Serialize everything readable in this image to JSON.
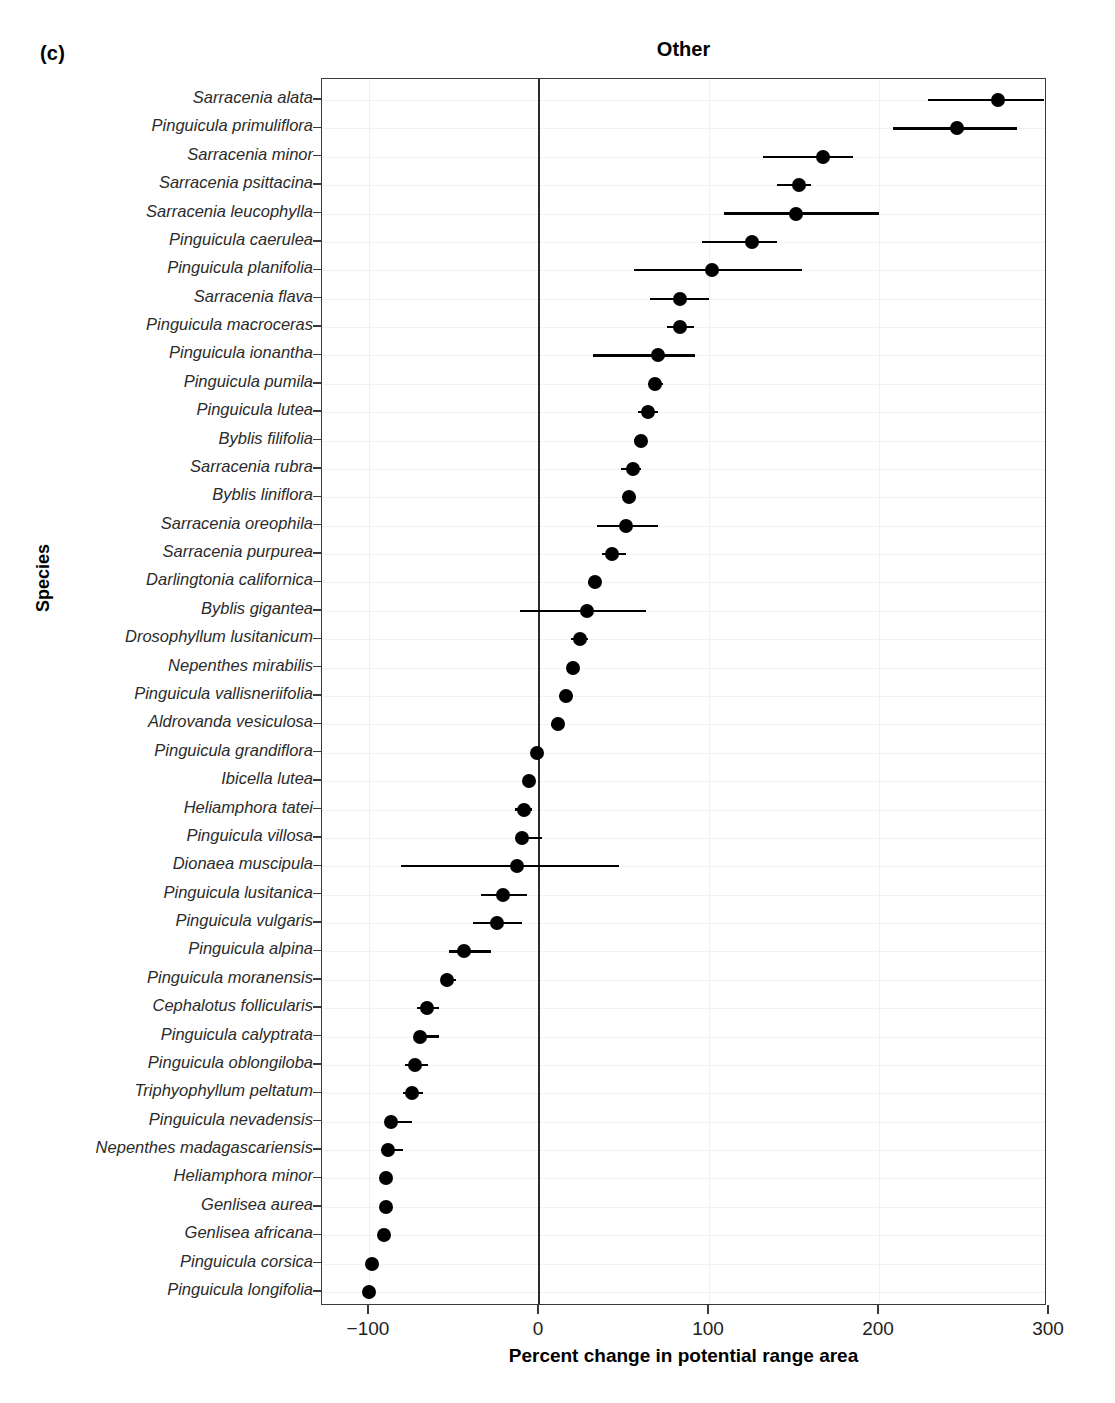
{
  "panel_letter": "(c)",
  "chart_data": {
    "type": "scatter",
    "subtype": "forest-plot",
    "title": "Other",
    "xlabel": "Percent change in potential range area",
    "ylabel": "Species",
    "xlim": [
      -125,
      320
    ],
    "xticks": [
      -100,
      0,
      100,
      200,
      300
    ],
    "xtick_labels": [
      "−100",
      "0",
      "100",
      "200",
      "300"
    ],
    "grid": true,
    "zero_reference_line": 0,
    "marker_color": "#000000",
    "error_bar_color": "#000000",
    "categories": [
      "Sarracenia alata",
      "Pinguicula primuliflora",
      "Sarracenia minor",
      "Sarracenia psittacina",
      "Sarracenia leucophylla",
      "Pinguicula caerulea",
      "Pinguicula planifolia",
      "Sarracenia flava",
      "Pinguicula macroceras",
      "Pinguicula ionantha",
      "Pinguicula pumila",
      "Pinguicula lutea",
      "Byblis filifolia",
      "Sarracenia rubra",
      "Byblis liniflora",
      "Sarracenia oreophila",
      "Sarracenia purpurea",
      "Darlingtonia californica",
      "Byblis gigantea",
      "Drosophyllum lusitanicum",
      "Nepenthes mirabilis",
      "Pinguicula vallisneriifolia",
      "Aldrovanda vesiculosa",
      "Pinguicula grandiflora",
      "Ibicella lutea",
      "Heliamphora tatei",
      "Pinguicula villosa",
      "Dionaea muscipula",
      "Pinguicula lusitanica",
      "Pinguicula vulgaris",
      "Pinguicula alpina",
      "Pinguicula moranensis",
      "Cephalotus follicularis",
      "Pinguicula calyptrata",
      "Pinguicula oblongiloba",
      "Triphyophyllum peltatum",
      "Pinguicula nevadensis",
      "Nepenthes madagascariensis",
      "Heliamphora minor",
      "Genlisea aurea",
      "Genlisea africana",
      "Pinguicula corsica",
      "Pinguicula longifolia"
    ],
    "values": [
      270,
      246,
      167,
      153,
      151,
      125,
      102,
      83,
      83,
      70,
      68,
      64,
      60,
      55,
      53,
      51,
      43,
      33,
      28,
      24,
      20,
      16,
      11,
      -1,
      -6,
      -9,
      -10,
      -13,
      -21,
      -25,
      -44,
      -54,
      -66,
      -70,
      -73,
      -75,
      -87,
      -89,
      -90,
      -90,
      -91,
      -98,
      -100
    ],
    "ci_lower": [
      229,
      208,
      132,
      140,
      109,
      96,
      56,
      65,
      75,
      32,
      64,
      58,
      56,
      48,
      49,
      34,
      37,
      29,
      -11,
      19,
      17,
      12,
      7,
      -4,
      -8,
      -14,
      -14,
      -81,
      -34,
      -39,
      -53,
      -57,
      -72,
      -68,
      -79,
      -80,
      -90,
      -93,
      -92,
      -92,
      -93,
      -100,
      -102
    ],
    "ci_upper": [
      297,
      281,
      185,
      160,
      200,
      140,
      155,
      100,
      91,
      92,
      73,
      70,
      63,
      60,
      57,
      70,
      51,
      36,
      63,
      29,
      23,
      20,
      15,
      2,
      -4,
      -4,
      2,
      47,
      -7,
      -10,
      -28,
      -49,
      -59,
      -59,
      -65,
      -68,
      -75,
      -80,
      -88,
      -88,
      -89,
      -97,
      -99
    ]
  }
}
